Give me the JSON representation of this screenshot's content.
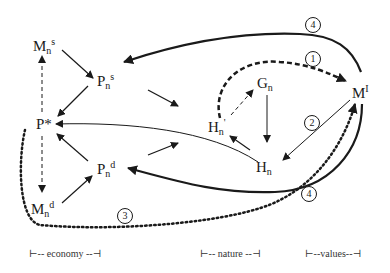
{
  "nodes": {
    "mns": {
      "base": "M",
      "sub": "n",
      "sup": "s"
    },
    "pns": {
      "base": "P",
      "sub": "n",
      "sup": "s"
    },
    "pstar": {
      "base": "P*"
    },
    "pnd": {
      "base": "P",
      "sub": "n",
      "sup": "d"
    },
    "mnd": {
      "base": "M",
      "sub": "n",
      "sup": "d"
    },
    "gn": {
      "base": "G",
      "sub": "n"
    },
    "hnprime": {
      "base": "H",
      "sub": "n",
      "sup": "'"
    },
    "hn": {
      "base": "H",
      "sub": "n"
    },
    "mi": {
      "base": "M",
      "sup": "I"
    }
  },
  "circled_labels": [
    "1",
    "2",
    "3",
    "4",
    "4"
  ],
  "legend": {
    "economy": "⊢-- economy --⊣",
    "nature": "⊢-- nature --⊣",
    "values": "⊢--values--⊣"
  }
}
